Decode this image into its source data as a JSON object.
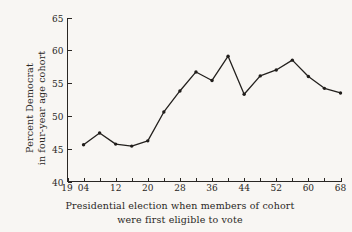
{
  "chart_data": {
    "type": "line",
    "title": "",
    "xlabel": "Presidential election when members of cohort were first eligible to vote",
    "ylabel": "Percent Democrat in four-year age cohort",
    "xlim": [
      1900,
      1968
    ],
    "ylim": [
      40,
      65
    ],
    "grid": false,
    "legend": "none",
    "x_tick_step_minor": 4,
    "x_tick_step_major": 8,
    "y_tick_step": 5,
    "x_axis_prefix": "19",
    "x_tick_labels": [
      "04",
      "12",
      "20",
      "28",
      "36",
      "44",
      "52",
      "60",
      "68"
    ],
    "x_tick_values": [
      1904,
      1912,
      1920,
      1928,
      1936,
      1944,
      1952,
      1960,
      1968
    ],
    "y_tick_labels": [
      "40",
      "45",
      "50",
      "55",
      "60",
      "65"
    ],
    "y_tick_values": [
      40,
      45,
      50,
      55,
      60,
      65
    ],
    "x": [
      1904,
      1908,
      1912,
      1916,
      1920,
      1924,
      1928,
      1932,
      1936,
      1940,
      1944,
      1948,
      1952,
      1956,
      1960,
      1964,
      1968
    ],
    "values": [
      45.6,
      47.4,
      45.7,
      45.4,
      46.2,
      50.6,
      53.8,
      56.7,
      55.4,
      59.1,
      53.3,
      56.1,
      57.0,
      58.5,
      56.0,
      54.2,
      53.5
    ],
    "series": [
      {
        "name": "Percent Democrat",
        "values": [
          45.6,
          47.4,
          45.7,
          45.4,
          46.2,
          50.6,
          53.8,
          56.7,
          55.4,
          59.1,
          53.3,
          56.1,
          57.0,
          58.5,
          56.0,
          54.2,
          53.5
        ]
      }
    ]
  },
  "axis_titles": {
    "y_line1": "Percent Democrat",
    "y_line2": "in four-year age cohort"
  },
  "caption": {
    "line1": "Presidential election when members of cohort",
    "line2": "were first eligible to vote"
  },
  "colors": {
    "background": "#f8f6f3",
    "ink": "#2a2724",
    "line": "#23201d"
  }
}
